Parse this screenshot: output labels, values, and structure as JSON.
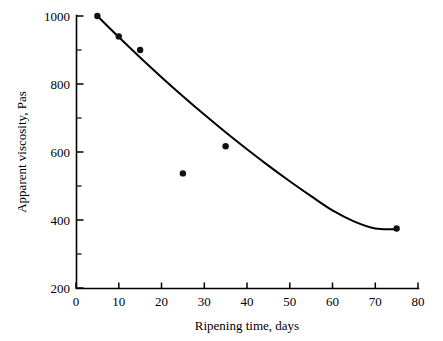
{
  "chart_data": {
    "type": "scatter",
    "title": "",
    "xlabel": "Ripening time, days",
    "ylabel": "Apparent viscosity, Pas",
    "xlim": [
      0,
      80
    ],
    "ylim": [
      200,
      1000
    ],
    "grid": false,
    "legend": null,
    "x_ticks": [
      0,
      10,
      20,
      30,
      40,
      50,
      60,
      70,
      80
    ],
    "x_tick_labels": [
      "0",
      "10",
      "20",
      "30",
      "40",
      "50",
      "60",
      "70",
      "80"
    ],
    "y_ticks": [
      200,
      400,
      600,
      800,
      1000
    ],
    "y_tick_labels": [
      "200",
      "400",
      "600",
      "800",
      "1000"
    ],
    "y_minor_ticks": [
      300,
      500,
      700,
      900
    ],
    "marker_color": "#111111",
    "line_color": "#000000",
    "axis_color": "#000000",
    "background_color": "#ffffff",
    "x": [
      5,
      10,
      15,
      25,
      35,
      75
    ],
    "y": [
      1000,
      940,
      900,
      537,
      617,
      375
    ],
    "points": [
      {
        "x": 5,
        "y": 1000
      },
      {
        "x": 10,
        "y": 940
      },
      {
        "x": 15,
        "y": 900
      },
      {
        "x": 25,
        "y": 537
      },
      {
        "x": 35,
        "y": 617
      },
      {
        "x": 75,
        "y": 375
      }
    ],
    "series": [
      {
        "name": "Apparent viscosity",
        "x": [
          5,
          10,
          15,
          25,
          35,
          75
        ],
        "values": [
          1000,
          940,
          900,
          537,
          617,
          375
        ]
      }
    ],
    "fit_curve": {
      "name": "quadratic trend line",
      "x_start": 5,
      "x_end": 75,
      "minimum_x": 67,
      "minimum_y": 368,
      "x_samples": [
        5,
        10,
        15,
        20,
        25,
        30,
        35,
        40,
        45,
        50,
        55,
        60,
        65,
        70,
        75
      ],
      "y_samples": [
        1000,
        938,
        878,
        820,
        764,
        710,
        658,
        608,
        560,
        514,
        470,
        428,
        396,
        375,
        373
      ]
    }
  }
}
